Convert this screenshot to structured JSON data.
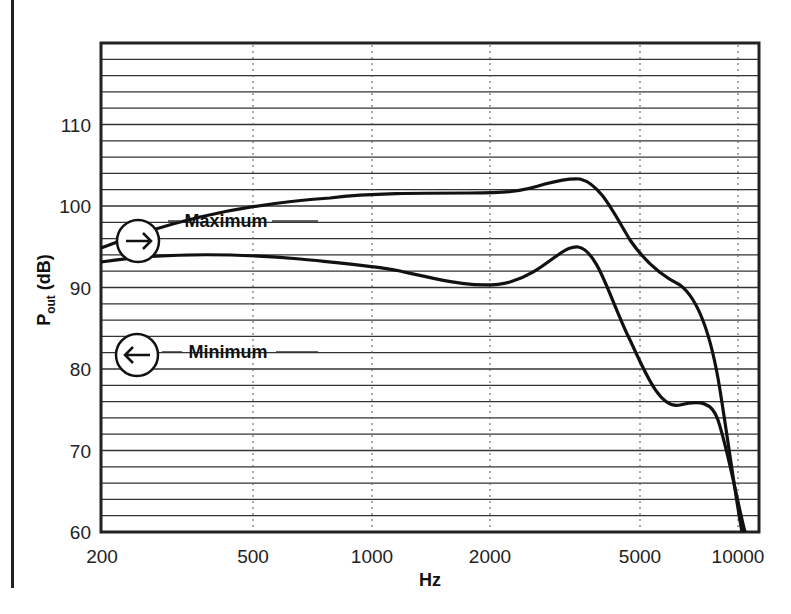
{
  "title_fragment": "",
  "chart_data": {
    "type": "line",
    "title": "",
    "xlabel": "Hz",
    "ylabel": "P_out (dB)",
    "xscale": "log",
    "xlim": [
      200,
      11000
    ],
    "ylim": [
      60,
      120
    ],
    "x_ticks": [
      "200",
      "500",
      "1000",
      "2000",
      "5000",
      "10000"
    ],
    "y_ticks": [
      "60",
      "70",
      "80",
      "90",
      "100",
      "110"
    ],
    "grid": {
      "horizontal_step_db": 2,
      "vertical": "dotted at ticks"
    },
    "series": [
      {
        "name": "Maximum",
        "marker": "arrow-right-circle",
        "x": [
          200,
          300,
          500,
          700,
          1000,
          1500,
          2000,
          2500,
          3000,
          3500,
          4000,
          5000,
          6000,
          7000,
          8000,
          9000,
          10000,
          10500
        ],
        "values": [
          88,
          91.5,
          95,
          97,
          98,
          98.2,
          98.2,
          98.8,
          99.8,
          99.6,
          97,
          92.5,
          89.5,
          87.5,
          83,
          75,
          65,
          60
        ]
      },
      {
        "name": "Minimum",
        "marker": "arrow-left-circle",
        "x": [
          200,
          300,
          500,
          700,
          1000,
          1500,
          2000,
          2500,
          3000,
          3500,
          4000,
          5000,
          6000,
          7000,
          8000,
          9000,
          10000
        ],
        "values": [
          86.3,
          87,
          86.5,
          86,
          85,
          83.5,
          83.5,
          85.5,
          88.5,
          88.5,
          85,
          77,
          75.5,
          75.5,
          71,
          66,
          60
        ]
      }
    ],
    "annotations": [
      {
        "text": "Maximum",
        "arrow": "→"
      },
      {
        "text": "Minimum",
        "arrow": "←"
      }
    ]
  }
}
